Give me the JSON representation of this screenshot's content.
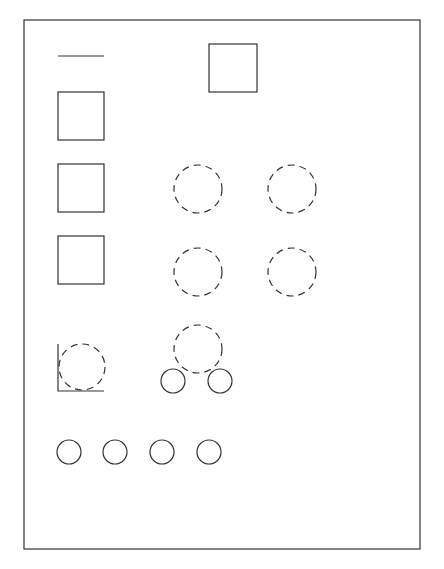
{
  "canvas": {
    "width": 444,
    "height": 569,
    "background": "#ffffff",
    "stroke": "#333333"
  },
  "frame": {
    "x": 24,
    "y": 20,
    "w": 396,
    "h": 529
  },
  "line": {
    "x1": 58,
    "y1": 56,
    "x2": 104,
    "y2": 56
  },
  "squares": [
    {
      "x": 209,
      "y": 44,
      "w": 48,
      "h": 48
    },
    {
      "x": 58,
      "y": 92,
      "w": 46,
      "h": 48
    },
    {
      "x": 58,
      "y": 164,
      "w": 46,
      "h": 48
    },
    {
      "x": 58,
      "y": 236,
      "w": 46,
      "h": 48
    }
  ],
  "dashed_circles": [
    {
      "cx": 198,
      "cy": 189,
      "r": 24
    },
    {
      "cx": 292,
      "cy": 189,
      "r": 24
    },
    {
      "cx": 198,
      "cy": 272,
      "r": 24
    },
    {
      "cx": 292,
      "cy": 272,
      "r": 24
    },
    {
      "cx": 82,
      "cy": 367,
      "r": 23
    },
    {
      "cx": 198,
      "cy": 349,
      "r": 24
    }
  ],
  "corner": {
    "x": 58,
    "top": 344,
    "bottom": 391,
    "right": 104
  },
  "solid_circles": [
    {
      "cx": 173,
      "cy": 381,
      "r": 12
    },
    {
      "cx": 220,
      "cy": 381,
      "r": 12
    },
    {
      "cx": 69,
      "cy": 452,
      "r": 12
    },
    {
      "cx": 115,
      "cy": 452,
      "r": 12
    },
    {
      "cx": 162,
      "cy": 452,
      "r": 12
    },
    {
      "cx": 209,
      "cy": 452,
      "r": 12
    }
  ]
}
